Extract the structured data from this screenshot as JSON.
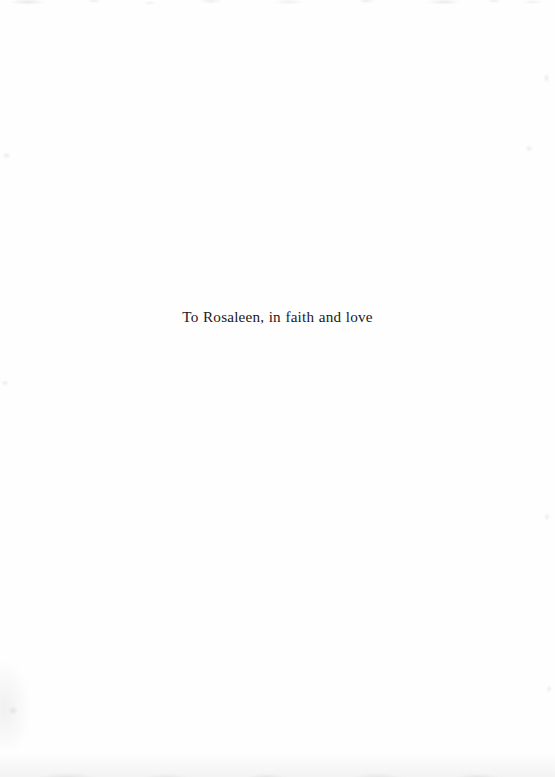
{
  "page": {
    "type": "book-dedication-page",
    "background_color": "#fefefe",
    "width": 555,
    "height": 777
  },
  "dedication": {
    "text": "To Rosaleen, in faith and love",
    "color": "#1c1a1a",
    "alignment": "center"
  },
  "artifacts": {
    "top_edge_noise_label": "",
    "bottom_edge_noise_label": "",
    "left_smudge_label": ""
  }
}
